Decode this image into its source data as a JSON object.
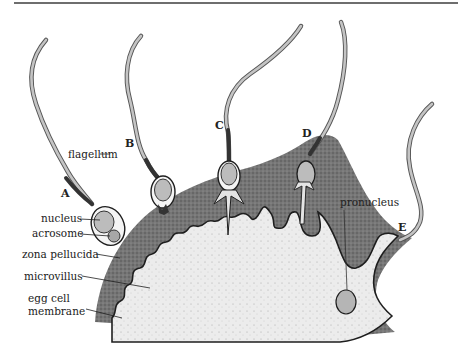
{
  "figure": {
    "type": "biology-diagram"
  },
  "stages": [
    {
      "id": "A",
      "label": "A"
    },
    {
      "id": "B",
      "label": "B"
    },
    {
      "id": "C",
      "label": "C"
    },
    {
      "id": "D",
      "label": "D"
    },
    {
      "id": "E",
      "label": "E"
    }
  ],
  "labels": {
    "flagellum": "flagellum",
    "nucleus": "nucleus",
    "acrosome": "acrosome",
    "zona_pellucida": "zona pellucida",
    "microvillus": "microvillus",
    "egg_cell_line1": "egg cell",
    "egg_cell_line2": "membrane",
    "pronucleus": "pronucleus"
  },
  "colors": {
    "zona": "#6f6f6f",
    "zona_dark": "#4a4a4a",
    "cytoplasm": "#e9e9e9",
    "outline": "#1e1e1e",
    "flagellum_fill": "#bdbdbd",
    "midpiece": "#3a3a3a",
    "head_fill": "#bcbcbc"
  }
}
